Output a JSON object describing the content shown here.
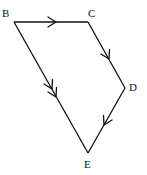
{
  "diagram": {
    "type": "vector-quadrilateral",
    "vertices": [
      {
        "id": "B",
        "label": "B",
        "x": 14,
        "y": 22
      },
      {
        "id": "C",
        "label": "C",
        "x": 88,
        "y": 22
      },
      {
        "id": "D",
        "label": "D",
        "x": 125,
        "y": 88
      },
      {
        "id": "E",
        "label": "E",
        "x": 88,
        "y": 153
      }
    ],
    "edges": [
      {
        "from": "B",
        "to": "C",
        "arrows": 1
      },
      {
        "from": "C",
        "to": "D",
        "arrows": 1
      },
      {
        "from": "D",
        "to": "E",
        "arrows": 1
      },
      {
        "from": "B",
        "to": "E",
        "arrows": 2
      }
    ],
    "labels": {
      "B": "B",
      "C": "C",
      "D": "D",
      "E": "E"
    },
    "stroke_color": "#111111",
    "background": "#ffffff"
  }
}
